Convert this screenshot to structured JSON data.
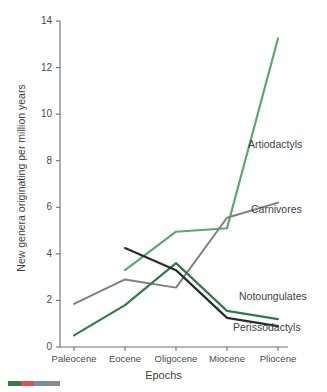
{
  "chart_data": {
    "type": "line",
    "title": "",
    "xlabel": "Epochs",
    "ylabel": "New genera originating per million years",
    "categories": [
      "Paleocene",
      "Eocene",
      "Oligocene",
      "Miocene",
      "Pliocene"
    ],
    "ylim": [
      0,
      14
    ],
    "yticks": [
      0,
      2,
      4,
      6,
      8,
      10,
      12,
      14
    ],
    "ytick_labels": [
      "0",
      "2",
      "4",
      "6",
      "8",
      "10",
      "12",
      "14"
    ],
    "grid": false,
    "legend_position": "inline-right-of-line-ends",
    "series": [
      {
        "name": "Artiodactyls",
        "color": "#5aa96b",
        "x": [
          "Eocene",
          "Oligocene",
          "Miocene",
          "Pliocene"
        ],
        "values": [
          3.3,
          4.95,
          5.1,
          13.25
        ]
      },
      {
        "name": "Carnivores",
        "color": "#7f7f7f",
        "x": [
          "Paleocene",
          "Eocene",
          "Oligocene",
          "Miocene",
          "Pliocene"
        ],
        "values": [
          1.85,
          2.9,
          2.55,
          5.55,
          6.2
        ]
      },
      {
        "name": "Notoungulates",
        "color": "#2f7d45",
        "x": [
          "Paleocene",
          "Eocene",
          "Oligocene",
          "Miocene",
          "Pliocene"
        ],
        "values": [
          0.5,
          1.8,
          3.6,
          1.55,
          1.2
        ]
      },
      {
        "name": "Perissodactyls",
        "color": "#2b2b2b",
        "x": [
          "Eocene",
          "Oligocene",
          "Miocene",
          "Pliocene"
        ],
        "values": [
          4.25,
          3.3,
          1.25,
          0.9
        ]
      }
    ]
  },
  "axis": {
    "y_title": "New genera originating per million years",
    "x_title": "Epochs"
  },
  "colors": {
    "artiodactyls": "#5aa96b",
    "carnivores": "#7f7f7f",
    "notoungulates": "#2f7d45",
    "perissodactyls": "#2b2b2b",
    "axis": "#6e6e6e",
    "text": "#3f3f3f"
  },
  "footer_swatch": {
    "segments": [
      "#2f7d45",
      "#d9534f",
      "#6f8fae",
      "#8a8a8a"
    ]
  }
}
